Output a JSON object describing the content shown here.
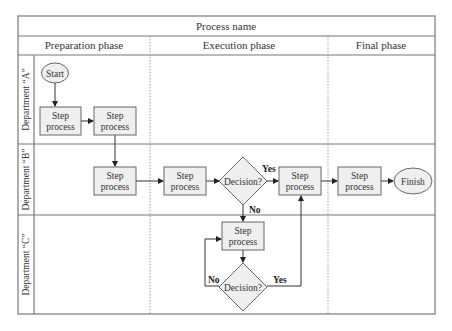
{
  "title": "Process name",
  "phases": [
    "Preparation phase",
    "Execution phase",
    "Final phase"
  ],
  "lanes": [
    "Department “A”",
    "Department “B”",
    "Department “C”"
  ],
  "nodes": {
    "start": "Start",
    "a_step1": [
      "Step",
      "process"
    ],
    "a_step2": [
      "Step",
      "process"
    ],
    "b_step1": [
      "Step",
      "process"
    ],
    "b_step2": [
      "Step",
      "process"
    ],
    "b_decision": "Decision?",
    "b_step3": [
      "Step",
      "process"
    ],
    "b_step4": [
      "Step",
      "process"
    ],
    "finish": "Finish",
    "c_step": [
      "Step",
      "process"
    ],
    "c_decision": "Decision?"
  },
  "edge_labels": {
    "b_yes": "Yes",
    "b_no": "No",
    "c_no": "No",
    "c_yes": "Yes"
  },
  "colors": {
    "shape_fill": "#efefef",
    "shape_stroke": "#666666",
    "line": "#333333"
  }
}
